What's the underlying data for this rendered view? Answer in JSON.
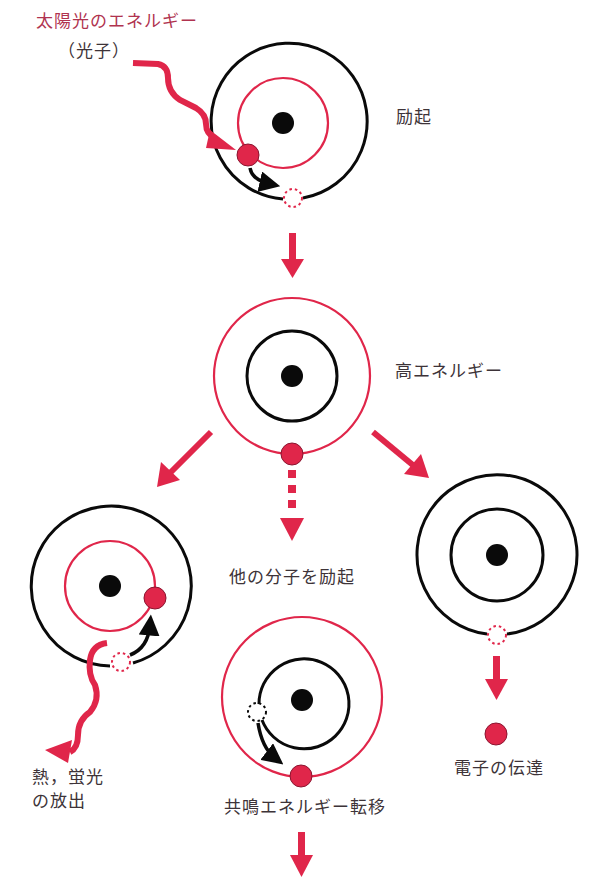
{
  "header": {
    "title_cut_off": ""
  },
  "colors": {
    "accent": "#e0264a",
    "accent_text": "#b0334f",
    "line_black": "#0a0a0a",
    "text": "#3d3338"
  },
  "labels": {
    "sunlight_energy": "太陽光のエネルギー",
    "photon": "（光子）",
    "excitation": "励起",
    "high_energy": "高エネルギー",
    "excite_other_molecules": "他の分子を励起",
    "heat_fluorescence_line1": "熱，蛍光",
    "heat_fluorescence_line2": "の放出",
    "resonance_energy_transfer": "共鳴エネルギー転移",
    "electron_transfer": "電子の伝達"
  },
  "nodes": [
    {
      "id": "excitation-atom",
      "label_ref": "excitation",
      "outer_ring": "black",
      "inner_ring": "red"
    },
    {
      "id": "high-energy-atom",
      "label_ref": "high_energy",
      "outer_ring": "red",
      "inner_ring": "black"
    },
    {
      "id": "heat-fluorescence-atom",
      "label_ref": "heat_fluorescence",
      "outer_ring": "black",
      "inner_ring": "red"
    },
    {
      "id": "resonance-transfer-atom",
      "label_ref": "resonance_energy_transfer",
      "outer_ring": "red",
      "inner_ring": "black"
    },
    {
      "id": "electron-transfer-atom",
      "label_ref": "electron_transfer",
      "outer_ring": "black",
      "inner_ring": "black"
    }
  ],
  "edges": [
    {
      "from": "sunlight",
      "to": "excitation-atom",
      "style": "wavy"
    },
    {
      "from": "excitation-atom",
      "to": "high-energy-atom",
      "style": "solid"
    },
    {
      "from": "high-energy-atom",
      "to": "heat-fluorescence-atom",
      "style": "solid"
    },
    {
      "from": "high-energy-atom",
      "to": "resonance-transfer-atom",
      "style": "dotted",
      "label_ref": "excite_other_molecules"
    },
    {
      "from": "high-energy-atom",
      "to": "electron-transfer-atom",
      "style": "solid"
    },
    {
      "from": "heat-fluorescence-atom",
      "to": "emission",
      "style": "wavy"
    },
    {
      "from": "resonance-transfer-atom",
      "to": "next",
      "style": "solid"
    },
    {
      "from": "electron-transfer-atom",
      "to": "electron",
      "style": "solid"
    }
  ]
}
